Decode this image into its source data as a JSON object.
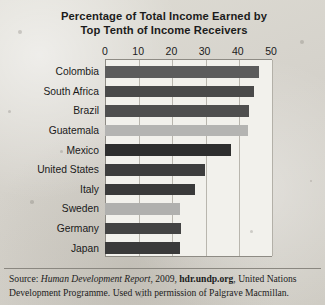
{
  "chart_data": {
    "type": "bar",
    "orientation": "horizontal",
    "title": "Percentage of Total Income Earned by Top Tenth of Income Receivers",
    "title_line1": "Percentage of Total Income Earned by",
    "title_line2": "Top Tenth of Income Receivers",
    "xlabel": "",
    "ylabel": "",
    "xlim": [
      0,
      50
    ],
    "xticks": [
      0,
      10,
      20,
      30,
      40,
      50
    ],
    "xtick_labels": [
      "0",
      "10",
      "20",
      "30",
      "40",
      "50"
    ],
    "grid": true,
    "grid_axis": "x",
    "legend": false,
    "categories": [
      "Colombia",
      "South Africa",
      "Brazil",
      "Guatemala",
      "Mexico",
      "United States",
      "Italy",
      "Sweden",
      "Germany",
      "Japan"
    ],
    "values": [
      46.5,
      45.0,
      43.5,
      43.0,
      38.0,
      30.0,
      27.0,
      22.5,
      23.0,
      22.5
    ],
    "bar_colors": [
      "#5c5c5c",
      "#4a4a4a",
      "#4f4f4f",
      "#b4b4b2",
      "#2e2e2e",
      "#3d3d3d",
      "#3a3a3a",
      "#b0b0ae",
      "#434343",
      "#3a3a3a"
    ]
  },
  "source": {
    "prefix": "Source: ",
    "report": "Human Development Report",
    "year": ", 2009, ",
    "url": "hdr.undp.org",
    "suffix": ", United Nations Development Programme. Used with permission of Palgrave Macmillan."
  }
}
